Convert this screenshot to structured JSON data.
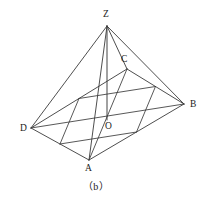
{
  "figure": {
    "caption": "（b）",
    "caption_position": {
      "x": 83,
      "y": 182
    },
    "background_color": "#ffffff",
    "stroke_color": "#3a3a3a",
    "label_color": "#1b1b1b",
    "stroke_width": 0.9,
    "vertices": [
      {
        "name": "Z",
        "label": "Z",
        "x": 107,
        "y": 26,
        "label_x": 103,
        "label_y": 10,
        "role": "apex"
      },
      {
        "name": "C",
        "label": "C",
        "x": 127,
        "y": 69,
        "label_x": 121,
        "label_y": 55,
        "role": "base-corner"
      },
      {
        "name": "B",
        "label": "B",
        "x": 184,
        "y": 104,
        "label_x": 190,
        "label_y": 100,
        "role": "base-corner"
      },
      {
        "name": "A",
        "label": "A",
        "x": 89,
        "y": 160,
        "label_x": 85,
        "label_y": 164,
        "role": "base-corner"
      },
      {
        "name": "D",
        "label": "D",
        "x": 31,
        "y": 128,
        "label_x": 20,
        "label_y": 124,
        "role": "base-corner"
      },
      {
        "name": "O",
        "label": "O",
        "x": 107,
        "y": 120,
        "label_x": 105,
        "label_y": 122,
        "role": "base-center"
      }
    ],
    "midpoints": [
      {
        "name": "M_DC",
        "x": 79,
        "y": 98.5
      },
      {
        "name": "M_CB",
        "x": 155.5,
        "y": 86.5
      },
      {
        "name": "M_BA",
        "x": 136.5,
        "y": 132
      },
      {
        "name": "M_AD",
        "x": 60,
        "y": 144
      }
    ],
    "edges": [
      {
        "name": "ZD",
        "from": "Z",
        "to": "D",
        "kind": "lateral"
      },
      {
        "name": "ZC",
        "from": "Z",
        "to": "C",
        "kind": "lateral"
      },
      {
        "name": "ZB",
        "from": "Z",
        "to": "B",
        "kind": "lateral"
      },
      {
        "name": "ZA",
        "from": "Z",
        "to": "A",
        "kind": "lateral"
      },
      {
        "name": "ZO",
        "from": "Z",
        "to": "O",
        "kind": "altitude"
      },
      {
        "name": "DC",
        "from": "D",
        "to": "C",
        "kind": "base"
      },
      {
        "name": "CB",
        "from": "C",
        "to": "B",
        "kind": "base"
      },
      {
        "name": "BA",
        "from": "B",
        "to": "A",
        "kind": "base"
      },
      {
        "name": "AD",
        "from": "A",
        "to": "D",
        "kind": "base"
      },
      {
        "name": "DB",
        "from": "D",
        "to": "B",
        "kind": "diagonal"
      },
      {
        "name": "CA",
        "from": "C",
        "to": "A",
        "kind": "diagonal"
      },
      {
        "name": "MDC-MCB",
        "from": "M_DC",
        "to": "M_CB",
        "kind": "inner"
      },
      {
        "name": "MCB-MBA",
        "from": "M_CB",
        "to": "M_BA",
        "kind": "inner"
      },
      {
        "name": "MBA-MAD",
        "from": "M_BA",
        "to": "M_AD",
        "kind": "inner"
      },
      {
        "name": "MAD-MDC",
        "from": "M_AD",
        "to": "M_DC",
        "kind": "inner"
      }
    ]
  }
}
